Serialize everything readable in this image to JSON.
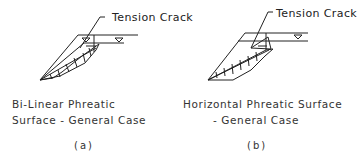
{
  "figures": [
    {
      "id": "a",
      "annotation": "Tension Crack",
      "caption_line1": "Bi-Linear Phreatic",
      "caption_line2": "Surface - General Case",
      "sublabel": "(a)"
    },
    {
      "id": "b",
      "annotation": "Tension Crack",
      "caption_line1": "Horizontal Phreatic Surface",
      "caption_line2": "- General Case",
      "sublabel": "(b)"
    }
  ]
}
